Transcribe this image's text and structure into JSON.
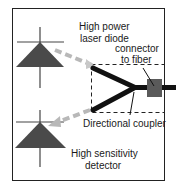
{
  "diagram": {
    "labels": {
      "laser_line1": "High power",
      "laser_line2": "laser diode",
      "connector_line1": "connector",
      "connector_line2": "to fiber",
      "coupler": "Directional coupler",
      "detector_line1": "High sensitivity",
      "detector_line2": "detector"
    },
    "components": [
      {
        "id": "laser-diode",
        "symbol": "diode-triangle",
        "color": "#4a4a4a"
      },
      {
        "id": "detector",
        "symbol": "diode-triangle",
        "color": "#4a4a4a"
      },
      {
        "id": "directional-coupler",
        "symbol": "y-junction",
        "color": "#111111"
      },
      {
        "id": "fiber-connector",
        "symbol": "square",
        "color": "#5a5a5a"
      }
    ],
    "arrows": [
      {
        "from": "laser-diode",
        "to": "directional-coupler",
        "style": "dashed",
        "color": "#b8b8b8"
      },
      {
        "from": "directional-coupler",
        "to": "detector",
        "style": "dashed",
        "color": "#b8b8b8"
      }
    ],
    "colors": {
      "frame": "#222222",
      "triangle": "#4a4a4a",
      "fiber": "#111111",
      "connector": "#5a5a5a",
      "beam": "#b8b8b8"
    }
  }
}
